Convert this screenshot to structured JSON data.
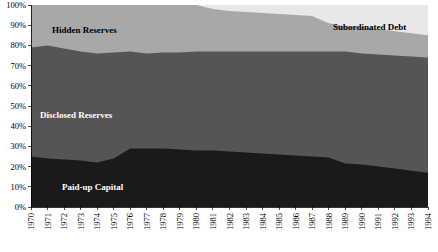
{
  "chart_data": {
    "type": "area",
    "stacked": true,
    "normalized_percent": true,
    "title": "",
    "subtitle": "",
    "xlabel": "",
    "ylabel": "",
    "grid": false,
    "legend_position": "inline-labels",
    "ylim": [
      0,
      100
    ],
    "ytick_labels": [
      "0%",
      "10%",
      "20%",
      "30%",
      "40%",
      "50%",
      "60%",
      "70%",
      "80%",
      "90%",
      "100%"
    ],
    "ytick_values": [
      0,
      10,
      20,
      30,
      40,
      50,
      60,
      70,
      80,
      90,
      100
    ],
    "categories": [
      "1970",
      "1971",
      "1972",
      "1973",
      "1974",
      "1975",
      "1976",
      "1977",
      "1978",
      "1979",
      "1980",
      "1981",
      "1982",
      "1983",
      "1984",
      "1985",
      "1986",
      "1987",
      "1988",
      "1989",
      "1990",
      "1991",
      "1992",
      "1993",
      "1994"
    ],
    "x": [
      1970,
      1971,
      1972,
      1973,
      1974,
      1975,
      1976,
      1977,
      1978,
      1979,
      1980,
      1981,
      1982,
      1983,
      1984,
      1985,
      1986,
      1987,
      1988,
      1989,
      1990,
      1991,
      1992,
      1993,
      1994
    ],
    "series": [
      {
        "name": "Paid-up Capital",
        "color": "#1a1a1a",
        "label_color": "#ffffff",
        "values": [
          25,
          24,
          23.5,
          23,
          22,
          24,
          29,
          29,
          29,
          28.5,
          28,
          28,
          27.5,
          27,
          26.5,
          26,
          25.5,
          25,
          24.5,
          21.5,
          21,
          20,
          19,
          18,
          17
        ]
      },
      {
        "name": "Disclosed Reserves",
        "color": "#555555",
        "label_color": "#ffffff",
        "values": [
          54,
          56,
          55,
          54,
          54,
          52.5,
          48,
          47,
          47.5,
          48,
          49,
          49,
          49.5,
          50,
          50.5,
          51,
          51.5,
          52,
          52.5,
          55.5,
          55,
          55.5,
          56,
          56.5,
          57
        ]
      },
      {
        "name": "Hidden Reserves",
        "color": "#a8a8a8",
        "label_color": "#000000",
        "values": [
          21,
          20,
          21.5,
          23,
          24,
          23.5,
          23,
          24,
          23.5,
          23.5,
          23,
          21,
          20,
          19.5,
          19,
          18.5,
          18,
          17.5,
          14,
          12.5,
          13,
          12.5,
          12,
          11.5,
          11
        ]
      },
      {
        "name": "Subordinated Debt",
        "color": "#e8e8e8",
        "label_color": "#000000",
        "values": [
          0,
          0,
          0,
          0,
          0,
          0,
          0,
          0,
          0,
          0,
          0,
          2,
          3,
          3.5,
          4,
          4.5,
          5,
          5.5,
          9,
          10.5,
          11,
          12,
          13,
          14,
          15
        ]
      }
    ],
    "annotations": [
      {
        "text": "Hidden Reserves",
        "series": "Hidden Reserves",
        "x_px": 52,
        "y_px": 33,
        "color": "#000000"
      },
      {
        "text": "Subordinated Debt",
        "series": "Subordinated Debt",
        "x_px": 333,
        "y_px": 30,
        "color": "#000000"
      },
      {
        "text": "Disclosed Reserves",
        "series": "Disclosed Reserves",
        "x_px": 40,
        "y_px": 118,
        "color": "#ffffff"
      },
      {
        "text": "Paid-up Capital",
        "series": "Paid-up Capital",
        "x_px": 62,
        "y_px": 190,
        "color": "#ffffff"
      }
    ]
  },
  "plot": {
    "left_px": 31,
    "top_px": 5,
    "right_px": 428,
    "bottom_px": 207
  }
}
